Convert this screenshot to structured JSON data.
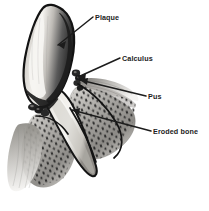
{
  "figure": {
    "background_color": "#ffffff",
    "line_color": "#1c1c1c",
    "text_color": "#1c1c1c",
    "enamel_highlight_color": "#f2f0ec",
    "enamel_shadow_color": "#2b2b2b",
    "dentin_color": "#eae6de",
    "bone_color": "#9b9b9b",
    "stipple_color": "#1f1f1f"
  },
  "labels": [
    {
      "id": "plaque",
      "text": "Plaque",
      "text_x": 95,
      "text_y": 20,
      "leader_from": [
        93,
        17
      ],
      "leader_to": [
        58,
        45
      ]
    },
    {
      "id": "calculus",
      "text": "Calculus",
      "text_x": 122,
      "text_y": 61,
      "leader_from": [
        120,
        58
      ],
      "leader_to": [
        78,
        77
      ]
    },
    {
      "id": "pus",
      "text": "Pus",
      "text_x": 148,
      "text_y": 99,
      "leader_from": [
        146,
        96
      ],
      "leader_to": [
        80,
        80
      ]
    },
    {
      "id": "eroded-bone",
      "text": "Eroded bone",
      "text_x": 153,
      "text_y": 134,
      "leader_from": [
        151,
        131
      ],
      "leader_to": [
        72,
        110
      ]
    }
  ],
  "anatomy": {
    "crown": "tooth-crown",
    "root": "tooth-root",
    "gum": "gum-tissue",
    "bone": "eroded-alveolar-bone",
    "calculus_deposit": "calculus-deposit",
    "pus_pocket": "pus-pocket"
  }
}
